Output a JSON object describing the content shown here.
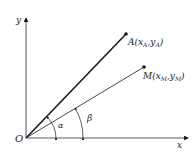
{
  "diagram": {
    "origin_label": "O",
    "x_axis_label": "x",
    "y_axis_label": "y",
    "point_a": {
      "name": "A",
      "sub": "A",
      "label_prefix": "A(",
      "x": "x",
      "y": "y",
      "close": ")"
    },
    "point_m": {
      "name": "M",
      "sub": "M",
      "label_prefix": "M(",
      "x": "x",
      "y": "y",
      "close": ")"
    },
    "angle_alpha": "α",
    "angle_beta": "β",
    "colors": {
      "line": "#1a1a1a",
      "thin_line": "#333333",
      "background": "#ffffff"
    }
  }
}
